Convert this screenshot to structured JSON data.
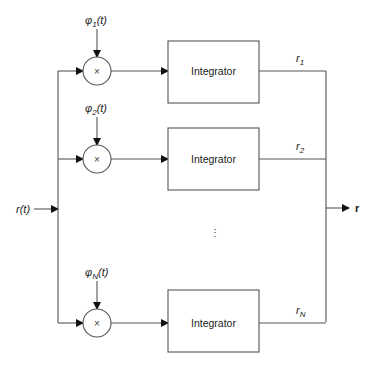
{
  "diagram": {
    "input": {
      "label_base": "r",
      "label_arg": "(t)"
    },
    "output": {
      "label": "r"
    },
    "branches": [
      {
        "basis_symbol": "φ",
        "basis_sub": "1",
        "basis_arg": "(t)",
        "multiplier": "×",
        "block": "Integrator",
        "out_base": "r",
        "out_sub": "1"
      },
      {
        "basis_symbol": "φ",
        "basis_sub": "2",
        "basis_arg": "(t)",
        "multiplier": "×",
        "block": "Integrator",
        "out_base": "r",
        "out_sub": "2"
      },
      {
        "basis_symbol": "φ",
        "basis_sub": "N",
        "basis_arg": "(t)",
        "multiplier": "×",
        "block": "Integrator",
        "out_base": "r",
        "out_sub": "N"
      }
    ],
    "ellipsis": "⋮"
  }
}
